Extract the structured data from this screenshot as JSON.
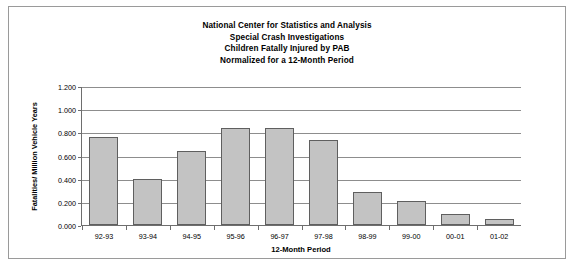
{
  "chart_data": {
    "type": "bar",
    "title": "National Center for Statistics and Analysis",
    "title_lines": [
      "National Center for Statistics and Analysis",
      "Special Crash Investigations",
      "Children Fatally Injured by PAB",
      "Normalized for a 12-Month Period"
    ],
    "subtitle": "Special Crash Investigations",
    "xlabel": "12-Month Period",
    "ylabel": "Fatalities/ Million Vehicle Years",
    "categories": [
      "92-93",
      "93-94",
      "94-95",
      "95-96",
      "96-97",
      "97-98",
      "98-99",
      "99-00",
      "00-01",
      "01-02"
    ],
    "values": [
      0.765,
      0.4,
      0.64,
      0.845,
      0.84,
      0.74,
      0.29,
      0.21,
      0.1,
      0.05
    ],
    "ylim": [
      0.0,
      1.2
    ],
    "ytick_values": [
      0.0,
      0.2,
      0.4,
      0.6,
      0.8,
      1.0,
      1.2
    ],
    "ytick_labels": [
      "0.000",
      "0.200",
      "0.400",
      "0.600",
      "0.800",
      "1.000",
      "1.200"
    ],
    "grid": true,
    "legend": false,
    "bar_color": "#c3c3c3",
    "bar_border_color": "#5f5f5f",
    "axis_color": "#6e6e6e",
    "gridline_color": "#8d8d8d",
    "background_color": "#ffffff",
    "frame_color": "#9a9a9a"
  }
}
